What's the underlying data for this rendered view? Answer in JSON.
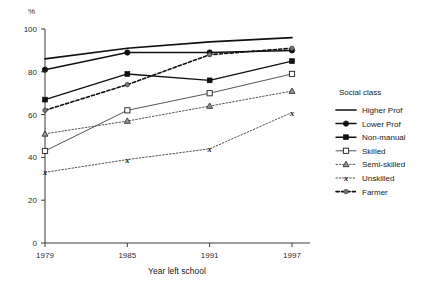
{
  "chart_data": {
    "type": "line",
    "title": "",
    "xlabel": "Year left school",
    "ylabel": "%",
    "unit_label": "%",
    "x": [
      1979,
      1985,
      1991,
      1997
    ],
    "xticklabels": [
      "1979",
      "1985",
      "1991",
      "1997"
    ],
    "yticks": [
      0,
      20,
      40,
      60,
      80,
      100
    ],
    "yticklabels": [
      "0",
      "20",
      "40",
      "60",
      "80",
      "100"
    ],
    "ylim": [
      0,
      100
    ],
    "grid": false,
    "legend_position": "right",
    "legend_title": "Social class",
    "series": [
      {
        "name": "Higher Prof",
        "values": [
          86,
          91,
          94,
          96
        ],
        "marker": "none",
        "dash": "solid",
        "width": 1.7,
        "color": "#111111"
      },
      {
        "name": "Lower Prof",
        "values": [
          81,
          89,
          89,
          90
        ],
        "marker": "circle-filled",
        "dash": "solid",
        "width": 1.5,
        "color": "#111111"
      },
      {
        "name": "Non-manual",
        "values": [
          67,
          79,
          76,
          85
        ],
        "marker": "square-filled",
        "dash": "solid",
        "width": 1.4,
        "color": "#111111"
      },
      {
        "name": "Skilled",
        "values": [
          43,
          62,
          70,
          79
        ],
        "marker": "square-open",
        "dash": "solid",
        "width": 1.0,
        "color": "#555555"
      },
      {
        "name": "Semi-skilled",
        "values": [
          51,
          57,
          64,
          71
        ],
        "marker": "triangle",
        "dash": "dotted",
        "width": 1.0,
        "color": "#555555"
      },
      {
        "name": "Unskilled",
        "values": [
          33,
          39,
          44,
          61
        ],
        "marker": "x",
        "dash": "dotted",
        "width": 1.0,
        "color": "#555555"
      },
      {
        "name": "Farmer",
        "values": [
          62,
          74,
          88,
          91
        ],
        "marker": "circle-small",
        "dash": "dashed",
        "width": 1.6,
        "color": "#111111"
      }
    ]
  },
  "legend": {
    "title": "Social class",
    "items": [
      {
        "label": "Higher Prof"
      },
      {
        "label": "Lower Prof"
      },
      {
        "label": "Non-manual"
      },
      {
        "label": "Skilled"
      },
      {
        "label": "Semi-skilled"
      },
      {
        "label": "Unskilled"
      },
      {
        "label": "Farmer"
      }
    ]
  }
}
